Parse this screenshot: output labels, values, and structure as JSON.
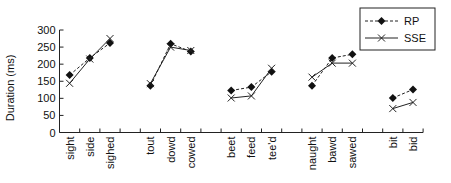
{
  "chart_data": {
    "type": "line",
    "title": "",
    "xlabel": "",
    "ylabel": "Duration (ms)",
    "ylim": [
      0,
      300
    ],
    "yticks": [
      0,
      50,
      100,
      150,
      200,
      250,
      300
    ],
    "grid": false,
    "legend_position": "top-right",
    "groups": [
      [
        "sight",
        "side",
        "sighed"
      ],
      [
        "tout",
        "dowd",
        "cowed"
      ],
      [
        "beet",
        "feed",
        "tee'd"
      ],
      [
        "naught",
        "bawd",
        "sawed"
      ],
      [
        "bit",
        "bid"
      ]
    ],
    "categories": [
      "sight",
      "side",
      "sighed",
      "tout",
      "dowd",
      "cowed",
      "beet",
      "feed",
      "tee'd",
      "naught",
      "bawd",
      "sawed",
      "bit",
      "bid"
    ],
    "series": [
      {
        "name": "RP",
        "line_style": "dashed",
        "marker": "diamond",
        "values": [
          168,
          218,
          262,
          137,
          260,
          237,
          123,
          133,
          178,
          137,
          218,
          229,
          101,
          126
        ]
      },
      {
        "name": "SSE",
        "line_style": "solid",
        "marker": "x",
        "values": [
          144,
          215,
          275,
          143,
          250,
          240,
          101,
          107,
          188,
          162,
          203,
          203,
          70,
          88
        ]
      }
    ]
  },
  "legend": {
    "items": [
      {
        "label": "RP"
      },
      {
        "label": "SSE"
      }
    ]
  },
  "axis": {
    "y_title": "Duration (ms)"
  }
}
